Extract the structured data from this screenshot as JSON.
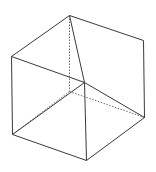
{
  "diagram": {
    "title": "",
    "background": "#ffffff",
    "line_color": "#3a3a3a",
    "hidden_line_color": "#6a6a6a",
    "vertices": {
      "top": [
        69,
        15
      ],
      "right_top": [
        143,
        40
      ],
      "right_bottom": [
        144,
        117
      ],
      "bottom": [
        86,
        160
      ],
      "left_bottom": [
        12,
        134
      ],
      "left_top": [
        11,
        56
      ],
      "center": [
        84,
        82
      ],
      "hidden": [
        69,
        91
      ]
    },
    "solid_edges": [
      [
        "top",
        "right_top"
      ],
      [
        "right_top",
        "right_bottom"
      ],
      [
        "right_bottom",
        "bottom"
      ],
      [
        "bottom",
        "left_bottom"
      ],
      [
        "left_bottom",
        "left_top"
      ],
      [
        "left_top",
        "top"
      ],
      [
        "left_top",
        "center"
      ],
      [
        "center",
        "bottom"
      ],
      [
        "center",
        "right_bottom"
      ],
      [
        "top",
        "center"
      ],
      [
        "left_bottom",
        "center"
      ]
    ],
    "dashed_edges": [
      [
        "top",
        "hidden"
      ],
      [
        "hidden",
        "left_bottom"
      ],
      [
        "hidden",
        "right_bottom"
      ]
    ]
  }
}
